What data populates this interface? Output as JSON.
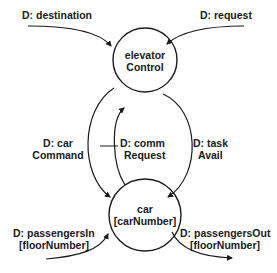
{
  "diagram": {
    "type": "data-flow",
    "processes": [
      {
        "id": "elevatorControl",
        "line1": "elevator",
        "line2": "Control"
      },
      {
        "id": "car",
        "line1": "car",
        "line2": "[carNumber]"
      }
    ],
    "flows": [
      {
        "id": "destination",
        "line1": "D: destination",
        "from": "external",
        "to": "elevatorControl"
      },
      {
        "id": "request",
        "line1": "D: request",
        "from": "external",
        "to": "elevatorControl"
      },
      {
        "id": "carCommand",
        "line1": "D: car",
        "line2": "Command",
        "from": "elevatorControl",
        "to": "car"
      },
      {
        "id": "commRequest",
        "line1": "D: comm",
        "line2": "Request",
        "from": "car",
        "to": "elevatorControl"
      },
      {
        "id": "taskAvail",
        "line1": "D: task",
        "line2": "Avail",
        "from": "elevatorControl",
        "to": "car"
      },
      {
        "id": "passengersIn",
        "line1": "D: passengersIn",
        "line2": "[floorNumber]",
        "from": "external",
        "to": "car"
      },
      {
        "id": "passengersOut",
        "line1": "D: passengersOut",
        "line2": "[floorNumber]",
        "from": "car",
        "to": "external"
      }
    ],
    "colors": {
      "ink": "#1a1a1a",
      "background": "#ffffff"
    }
  }
}
